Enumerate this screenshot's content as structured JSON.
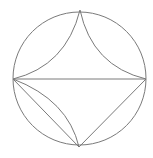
{
  "diagram": {
    "type": "geometry",
    "stroke_color": "#7a7a7a",
    "circle": {
      "cx": 79.5,
      "cy": 78.5,
      "r": 66.5
    },
    "points": {
      "top": [
        80,
        10
      ],
      "left": [
        13,
        79
      ],
      "right": [
        146,
        79
      ],
      "bottom": [
        79,
        147
      ]
    }
  }
}
